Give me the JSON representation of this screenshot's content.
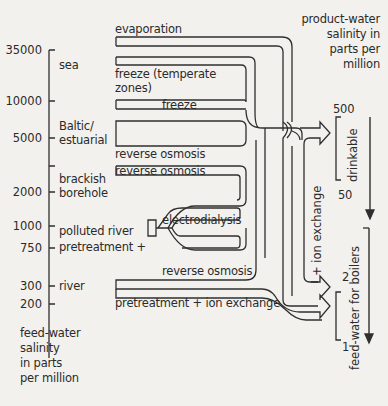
{
  "diagram": {
    "left_axis": {
      "label_lines": [
        "feed-water",
        "salinity",
        "in parts",
        "per million"
      ],
      "ticks": [
        "35000",
        "10000",
        "5000",
        "2000",
        "1000",
        "750",
        "300",
        "200"
      ],
      "sources": [
        {
          "name": "sea"
        },
        {
          "name_lines": [
            "Baltic/",
            "estuarial"
          ]
        },
        {
          "name_lines": [
            "brackish",
            "borehole"
          ]
        },
        {
          "name_lines": [
            "polluted river",
            "pretreatment +"
          ]
        },
        {
          "name": "river"
        }
      ]
    },
    "processes": {
      "evaporation": "evaporation",
      "freeze_temperate_1": "freeze (temperate",
      "freeze_temperate_2": "zones)",
      "freeze": "freeze",
      "ro_baltic": "reverse osmosis",
      "ro_brackish": "reverse osmosis",
      "electrodialysis": "electrodialysis",
      "ro_river": "reverse osmosis",
      "pretreat_ion": "pretreatment + ion exchange",
      "ion_exchange_vertical": "+ ion exchange"
    },
    "right_axis": {
      "label_lines": [
        "product-water",
        "salinity in",
        "parts per",
        "million"
      ],
      "drinkable": {
        "label": "drinkable",
        "high": "500",
        "low": "50"
      },
      "boilers": {
        "label": "feed-water for boilers",
        "high": "2",
        "low": "1"
      }
    }
  }
}
